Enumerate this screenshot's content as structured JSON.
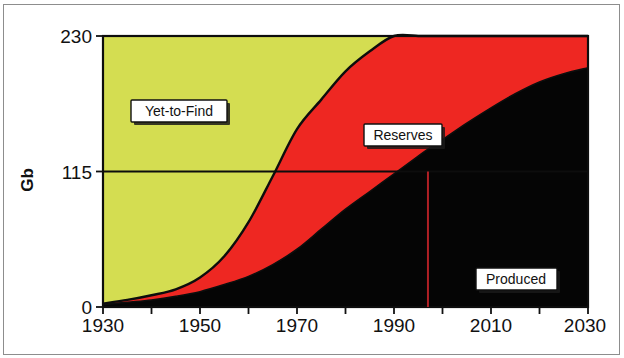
{
  "chart_data": {
    "type": "area",
    "title": "",
    "subtitle": "",
    "xlabel": "",
    "ylabel": "Gb",
    "xlim": [
      1930,
      2030
    ],
    "ylim": [
      0,
      230
    ],
    "xticks": [
      1930,
      1940,
      1950,
      1960,
      1970,
      1980,
      1990,
      2000,
      2010,
      2020,
      2030
    ],
    "xtick_labels": [
      "1930",
      "",
      "1950",
      "",
      "1970",
      "",
      "1990",
      "",
      "2010",
      "",
      "2030"
    ],
    "yticks": [
      0,
      115,
      230
    ],
    "ytick_labels": [
      "0",
      "115",
      "230"
    ],
    "grid": false,
    "legend_position": "inline-annotations",
    "stacked": true,
    "stack_order_bottom_to_top": [
      "Produced",
      "Reserves",
      "Yet-to-Find"
    ],
    "annotations": [
      {
        "text": "Yet-to-Find",
        "x": 1943,
        "y": 180
      },
      {
        "text": "Reserves",
        "x": 1988,
        "y": 134
      },
      {
        "text": "Produced",
        "x": 2013,
        "y": 30
      },
      {
        "text": "reference-line-115",
        "x": null,
        "y": 115
      },
      {
        "text": "marker-year-line",
        "x": 1997,
        "y": null
      }
    ],
    "reference_line_y": 115,
    "marker_line_x": 1997,
    "series": [
      {
        "name": "Produced",
        "color": "#050505",
        "x": [
          1930,
          1935,
          1940,
          1945,
          1950,
          1955,
          1960,
          1965,
          1970,
          1975,
          1980,
          1985,
          1990,
          1995,
          1997,
          2000,
          2005,
          2010,
          2015,
          2020,
          2025,
          2030
        ],
        "values": [
          2,
          4,
          6,
          9,
          13,
          19,
          26,
          36,
          49,
          66,
          83,
          98,
          113,
          128,
          134,
          142,
          156,
          169,
          181,
          191,
          198,
          203
        ]
      },
      {
        "name": "Reserves",
        "color": "#ee2722",
        "x": [
          1930,
          1935,
          1940,
          1945,
          1950,
          1955,
          1960,
          1965,
          1970,
          1975,
          1980,
          1985,
          1990,
          1995,
          1997,
          2000,
          2005,
          2010,
          2015,
          2020,
          2025,
          2030
        ],
        "values": [
          1,
          2,
          4,
          6,
          12,
          24,
          46,
          75,
          102,
          110,
          117,
          119,
          120,
          117,
          116,
          113,
          106,
          97,
          86,
          76,
          68,
          62
        ]
      },
      {
        "name": "Yet-to-Find",
        "color": "#d4dd51",
        "x": [
          1930,
          1935,
          1940,
          1945,
          1950,
          1955,
          1960,
          1965,
          1970,
          1975,
          1980,
          1985,
          1990,
          1995,
          1997,
          2000,
          2005,
          2010,
          2015,
          2020,
          2025,
          2030
        ],
        "values": [
          227,
          224,
          220,
          215,
          205,
          187,
          158,
          119,
          79,
          54,
          30,
          13,
          8,
          6,
          5,
          5,
          4,
          4,
          3,
          3,
          2,
          0
        ]
      }
    ],
    "cumulative_total_top": [
      230,
      230,
      230,
      230,
      230,
      230,
      230,
      230,
      230,
      230,
      230,
      230,
      241,
      251,
      255,
      260,
      266,
      270,
      270,
      270,
      268,
      265
    ]
  },
  "axis": {
    "y_title": "Gb",
    "y_tick_top": "230",
    "y_tick_mid": "115",
    "y_tick_bottom": "0",
    "x_tick_1930": "1930",
    "x_tick_1950": "1950",
    "x_tick_1970": "1970",
    "x_tick_1990": "1990",
    "x_tick_2010": "2010",
    "x_tick_2030": "2030"
  },
  "labels": {
    "yet_to_find": "Yet-to-Find",
    "reserves": "Reserves",
    "produced": "Produced"
  },
  "colors": {
    "yet_to_find": "#d4dd51",
    "reserves": "#ee2722",
    "produced": "#050505",
    "outline": "#0d0d0d",
    "marker_line": "#b02025",
    "background": "#ffffff",
    "frame": "#8d8d8d"
  }
}
